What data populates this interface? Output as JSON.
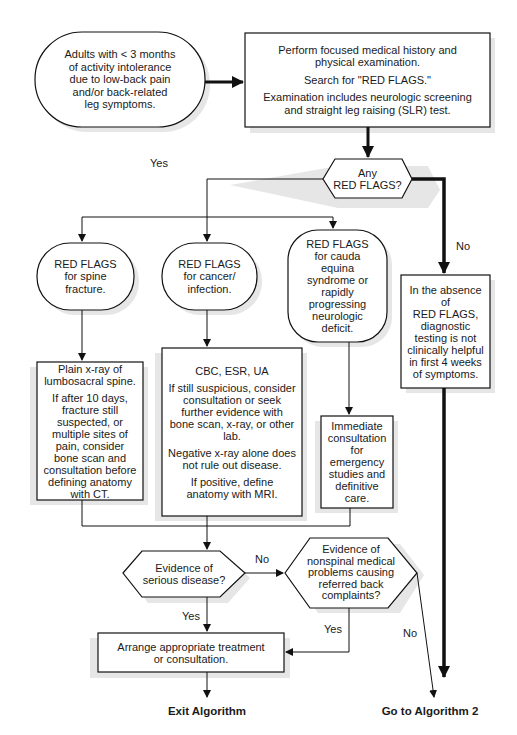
{
  "start": {
    "lines": [
      "Adults with < 3 months",
      "of activity intolerance",
      "due to low-back pain",
      "and/or back-related",
      "leg symptoms."
    ]
  },
  "exam_box": {
    "p1": "Perform focused medical history and physical examination.",
    "p2": "Search for \"RED FLAGS.\"",
    "p3": "Examination includes neurologic screening and straight leg raising (SLR) test."
  },
  "decision_red_flags": {
    "line1": "Any",
    "line2": "RED FLAGS?"
  },
  "labels": {
    "yes_top": "Yes",
    "no_top": "No",
    "no_serious": "No",
    "yes_serious": "Yes",
    "yes_nonspinal": "Yes",
    "no_nonspinal": "No"
  },
  "spine_fracture": {
    "lines": [
      "RED FLAGS",
      "for spine",
      "fracture."
    ]
  },
  "cancer_infection": {
    "lines": [
      "RED FLAGS",
      "for cancer/",
      "infection."
    ]
  },
  "cauda_equina": {
    "lines": [
      "RED FLAGS",
      "for cauda",
      "equina",
      "syndrome or",
      "rapidly",
      "progressing",
      "neurologic",
      "deficit."
    ]
  },
  "absence_box": {
    "lines": [
      "In the absence",
      "of",
      "RED FLAGS,",
      "diagnostic",
      "testing is not",
      "clinically helpful",
      "in first 4 weeks",
      "of symptoms."
    ]
  },
  "xray_box": {
    "p1": "Plain x-ray of lumbosacral spine.",
    "p2": "If after 10 days, fracture still suspected, or multiple sites of pain, consider bone scan and consultation before defining anatomy with CT."
  },
  "cbc_box": {
    "p1": "CBC, ESR, UA",
    "p2": "If still suspicious, consider consultation or seek further evidence with bone scan, x-ray, or other lab.",
    "p3": "Negative x-ray alone does not rule out disease.",
    "p4": "If positive, define anatomy with MRI."
  },
  "immediate_box": {
    "text": "Immediate consultation for emergency studies and definitive care."
  },
  "decision_serious": {
    "line1": "Evidence of",
    "line2": "serious disease?"
  },
  "decision_nonspinal": {
    "lines": [
      "Evidence of",
      "nonspinal medical",
      "problems causing",
      "referred back",
      "complaints?"
    ]
  },
  "arrange_box": {
    "line1": "Arrange appropriate treatment",
    "line2": "or consultation."
  },
  "terminals": {
    "exit": "Exit Algorithm",
    "goto": "Go to Algorithm 2"
  }
}
